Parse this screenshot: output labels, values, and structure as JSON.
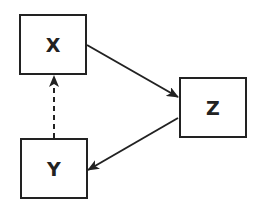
{
  "diagram": {
    "type": "directed-graph",
    "colors": {
      "stroke": "#222222",
      "background": "#ffffff"
    },
    "nodes": [
      {
        "id": "X",
        "label": "X",
        "x": 19,
        "y": 14,
        "w": 68,
        "h": 61
      },
      {
        "id": "Z",
        "label": "Z",
        "x": 179,
        "y": 77,
        "w": 68,
        "h": 61
      },
      {
        "id": "Y",
        "label": "Y",
        "x": 20,
        "y": 138,
        "w": 68,
        "h": 61
      }
    ],
    "edges": [
      {
        "from": "X",
        "to": "Z",
        "style": "solid",
        "x1": 87,
        "y1": 45,
        "x2": 178,
        "y2": 97
      },
      {
        "from": "Z",
        "to": "Y",
        "style": "solid",
        "x1": 178,
        "y1": 118,
        "x2": 88,
        "y2": 170
      },
      {
        "from": "Y",
        "to": "X",
        "style": "dashed",
        "x1": 54,
        "y1": 138,
        "x2": 54,
        "y2": 76
      }
    ]
  }
}
